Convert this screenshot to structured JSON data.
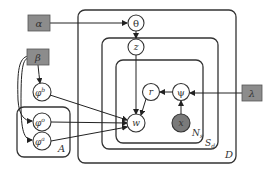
{
  "diagram": {
    "type": "plate-notation graphical model",
    "hyperparameters": [
      {
        "id": "alpha",
        "label": "α"
      },
      {
        "id": "beta",
        "label": "β"
      },
      {
        "id": "lambda",
        "label": "λ"
      }
    ],
    "latent_nodes": [
      {
        "id": "theta",
        "label": "θ"
      },
      {
        "id": "z",
        "label": "z"
      },
      {
        "id": "r",
        "label": "r"
      },
      {
        "id": "psi",
        "label": "ψ"
      },
      {
        "id": "w",
        "label": "w"
      },
      {
        "id": "phi_b",
        "label": "φ",
        "sup": "b"
      },
      {
        "id": "phi_o",
        "label": "φ",
        "sup": "o"
      },
      {
        "id": "phi_a",
        "label": "φ",
        "sup": "a"
      }
    ],
    "observed_nodes": [
      {
        "id": "x",
        "label": "x"
      }
    ],
    "plates": [
      {
        "id": "D",
        "label": "D"
      },
      {
        "id": "S_d",
        "label": "S",
        "sub": "d"
      },
      {
        "id": "N_s",
        "label": "N",
        "sub": "s"
      },
      {
        "id": "A",
        "label": "A"
      }
    ],
    "edges": [
      [
        "alpha",
        "theta"
      ],
      [
        "theta",
        "z"
      ],
      [
        "z",
        "w"
      ],
      [
        "beta",
        "phi_b"
      ],
      [
        "beta",
        "phi_o"
      ],
      [
        "beta",
        "phi_a"
      ],
      [
        "phi_b",
        "w"
      ],
      [
        "phi_o",
        "w"
      ],
      [
        "phi_a",
        "w"
      ],
      [
        "lambda",
        "psi"
      ],
      [
        "x",
        "psi"
      ],
      [
        "psi",
        "r"
      ],
      [
        "r",
        "w"
      ]
    ],
    "colors": {
      "hyper_fill": "#8c8c8c",
      "observed_fill": "#7a7a7a",
      "stroke": "#333333"
    }
  }
}
